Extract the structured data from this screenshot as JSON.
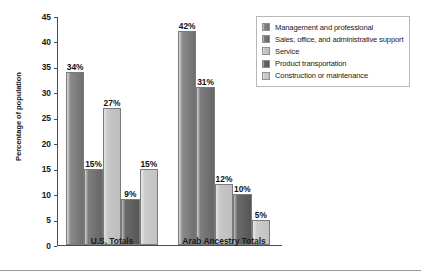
{
  "chart_data": {
    "type": "bar",
    "title": "",
    "xlabel": "",
    "ylabel": "Percentage of population",
    "ylim": [
      0,
      45
    ],
    "ytick_step": 5,
    "yticks": [
      45,
      40,
      35,
      30,
      25,
      20,
      15,
      10,
      5,
      0
    ],
    "grid": false,
    "legend_position": "top-right",
    "categories": [
      "U.S. Totals",
      "Arab Ancestry Totals"
    ],
    "series": [
      {
        "name": "Management and professional",
        "color": "#6f6f6f",
        "values": [
          34,
          42
        ],
        "labels": [
          "34%",
          "42%"
        ]
      },
      {
        "name": "Sales, office, and administrative support",
        "color": "#666666",
        "values": [
          15,
          31
        ],
        "labels": [
          "15%",
          "31%"
        ]
      },
      {
        "name": "Service",
        "color": "#bdbdbd",
        "values": [
          27,
          12
        ],
        "labels": [
          "27%",
          "12%"
        ]
      },
      {
        "name": "Product transportation",
        "color": "#565656",
        "values": [
          9,
          10
        ],
        "labels": [
          "9%",
          "10%"
        ]
      },
      {
        "name": "Construction or maintenance",
        "color": "#c2c2c2",
        "values": [
          15,
          5
        ],
        "labels": [
          "15%",
          "5%"
        ]
      }
    ]
  }
}
